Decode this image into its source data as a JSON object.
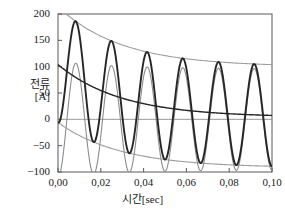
{
  "chart_data": {
    "type": "line",
    "title": "",
    "xlabel": "시간[sec]",
    "ylabel": "전류\n[A]",
    "ylabel_line1": "전류",
    "ylabel_line2": "[A]",
    "xlim": [
      0.0,
      0.1
    ],
    "ylim": [
      -100,
      200
    ],
    "xticks": [
      0.0,
      0.02,
      0.04,
      0.06,
      0.08,
      0.1
    ],
    "xticklabels": [
      "0,00",
      "0,02",
      "0,04",
      "0,06",
      "0,08",
      "0,10"
    ],
    "yticks": [
      -100,
      -50,
      0,
      50,
      100,
      150,
      200
    ],
    "yticklabels": [
      "−100",
      "−50",
      "0",
      "50",
      "100",
      "150",
      "200"
    ],
    "grid": false,
    "legend": "none",
    "frequency_hz": 60,
    "period_sec": 0.016667,
    "series": [
      {
        "name": "asymmetrical-short-circuit-current",
        "color": "#262626",
        "linewidth": 1.9,
        "description": "Total asymmetrical fault current: decaying DC offset plus symmetrical AC component; starts at 0 A.",
        "x": [
          0.0,
          0.002,
          0.004,
          0.006,
          0.008,
          0.0083,
          0.01,
          0.012,
          0.0145,
          0.0167,
          0.018,
          0.02,
          0.0225,
          0.0245,
          0.0265,
          0.0285,
          0.0305,
          0.0333,
          0.035,
          0.0375,
          0.041,
          0.045,
          0.05,
          0.0545,
          0.0585,
          0.0625,
          0.0665,
          0.0712,
          0.075,
          0.0792,
          0.0835,
          0.0875,
          0.0915,
          0.0958,
          0.1
        ],
        "y": [
          0,
          42,
          110,
          160,
          176,
          175,
          160,
          100,
          10,
          -88,
          -100,
          -60,
          40,
          110,
          143,
          138,
          90,
          -68,
          -85,
          -60,
          124,
          62,
          -66,
          20,
          114,
          55,
          -66,
          18,
          112,
          50,
          -66,
          16,
          106,
          44,
          -100
        ]
      },
      {
        "name": "symmetrical-ac-component",
        "color": "#8c8c8c",
        "linewidth": 1.1,
        "description": "Pure symmetrical AC component, amplitude ~100 A decaying slightly, starts at −100 A.",
        "x": [
          0.0,
          0.0042,
          0.0083,
          0.0125,
          0.0167,
          0.0208,
          0.025,
          0.0292,
          0.0333,
          0.0375,
          0.0417,
          0.0458,
          0.05,
          0.0542,
          0.0583,
          0.0625,
          0.0667,
          0.0708,
          0.075,
          0.0792,
          0.0833,
          0.0875,
          0.0917,
          0.0958,
          0.1
        ],
        "y": [
          -100,
          0,
          96,
          0,
          -100,
          0,
          92,
          0,
          -98,
          0,
          90,
          0,
          -97,
          0,
          88,
          0,
          -96,
          0,
          86,
          0,
          -95,
          0,
          85,
          0,
          -96
        ]
      },
      {
        "name": "upper-envelope",
        "color": "#9e9e9e",
        "linewidth": 1.1,
        "description": "Upper exponential envelope decaying from 200 A to about 107 A.",
        "x": [
          0.0,
          0.01,
          0.02,
          0.03,
          0.04,
          0.05,
          0.06,
          0.07,
          0.08,
          0.09,
          0.1
        ],
        "y": [
          200,
          178,
          160,
          146,
          135,
          126,
          120,
          115,
          112,
          109,
          107
        ]
      },
      {
        "name": "lower-envelope",
        "color": "#9e9e9e",
        "linewidth": 1.1,
        "description": "Lower exponential envelope rising from about 0 A to about −98 A.",
        "x": [
          0.0,
          0.01,
          0.02,
          0.03,
          0.04,
          0.05,
          0.06,
          0.07,
          0.08,
          0.09,
          0.1
        ],
        "y": [
          -2,
          -28,
          -47,
          -61,
          -72,
          -80,
          -86,
          -90,
          -94,
          -96,
          -98
        ]
      },
      {
        "name": "dc-offset-decay",
        "color": "#262626",
        "linewidth": 1.4,
        "description": "Decaying DC component from about 100 A at t=0 toward about 5 A at t=0.10 s.",
        "x": [
          0.0,
          0.01,
          0.02,
          0.03,
          0.04,
          0.05,
          0.06,
          0.07,
          0.08,
          0.09,
          0.1
        ],
        "y": [
          100,
          78,
          60,
          46,
          34,
          26,
          19,
          14,
          10,
          7,
          5
        ]
      },
      {
        "name": "zero-reference-line",
        "color": "#8c8c8c",
        "linewidth": 0.9,
        "description": "Horizontal reference line at 0 A.",
        "x": [
          0.0,
          0.1
        ],
        "y": [
          0,
          0
        ]
      }
    ],
    "axis_frame_color": "#595959"
  }
}
